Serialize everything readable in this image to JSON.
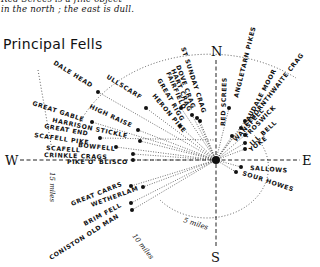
{
  "note": {
    "line1": "Red Screes is a fine object",
    "line2": "in the north ; the east is dull."
  },
  "title": "Principal Fells",
  "compass": {
    "north": "N",
    "south": "S",
    "east": "E",
    "west": "W"
  },
  "distance_rings": {
    "r5": "5 miles",
    "r10": "10 miles",
    "r15": "15 miles"
  },
  "fells": [
    {
      "name": "DALE HEAD"
    },
    {
      "name": "ULLSCARF"
    },
    {
      "name": "GREAT GABLE"
    },
    {
      "name": "HIGH RAISE"
    },
    {
      "name": "HARRISON STICKLE"
    },
    {
      "name": "GREAT END"
    },
    {
      "name": "SCAFELL PIKE"
    },
    {
      "name": "BOWFELL"
    },
    {
      "name": "SCAFELL"
    },
    {
      "name": "CRINKLE CRAGS"
    },
    {
      "name": "PIKE O' BLISCO"
    },
    {
      "name": "HERON PIKE"
    },
    {
      "name": "GREAT RIGG"
    },
    {
      "name": "FAIRFIELD"
    },
    {
      "name": "HART CRAG"
    },
    {
      "name": "DOVE CRAG"
    },
    {
      "name": "ST SUNDAY CRAG"
    },
    {
      "name": "RED SCREES"
    },
    {
      "name": "ANGLETARN PIKES"
    },
    {
      "name": "CAUDALE MOOR"
    },
    {
      "name": "THORNTHWAITE CRAG"
    },
    {
      "name": "WANSFELL"
    },
    {
      "name": "FROSWICK"
    },
    {
      "name": "ILL BELL"
    },
    {
      "name": "YOKE"
    },
    {
      "name": "SALLOWS"
    },
    {
      "name": "SOUR HOWES"
    },
    {
      "name": "GREAT CARRS"
    },
    {
      "name": "WETHERLAM"
    },
    {
      "name": "BRIM FELL"
    },
    {
      "name": "CONISTON OLD MAN"
    }
  ]
}
